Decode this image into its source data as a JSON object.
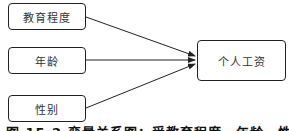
{
  "diagram": {
    "type": "flow",
    "nodes": [
      {
        "id": "education",
        "label": "教育程度"
      },
      {
        "id": "age",
        "label": "年龄"
      },
      {
        "id": "gender",
        "label": "性别"
      },
      {
        "id": "income",
        "label": "个人工资"
      }
    ],
    "edges": [
      {
        "from": "education",
        "to": "income"
      },
      {
        "from": "age",
        "to": "income"
      },
      {
        "from": "gender",
        "to": "income"
      }
    ],
    "caption": "图 15-2  变量关系图：受教育程度、年龄、性别"
  },
  "colors": {
    "stroke": "#222222",
    "text": "#333333",
    "background": "#ffffff"
  }
}
